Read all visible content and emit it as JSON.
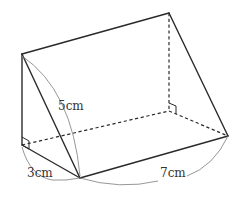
{
  "figure": {
    "type": "triangular prism",
    "colors": {
      "edge": "#2a2a2a",
      "dimension_line": "#8a8a8a",
      "label": "#333333"
    },
    "labels": {
      "height": "5cm",
      "base_width": "3cm",
      "length": "7cm"
    },
    "marks": [
      "right-angle at front-left bottom corner",
      "right-angle at back-right bottom corner"
    ]
  }
}
